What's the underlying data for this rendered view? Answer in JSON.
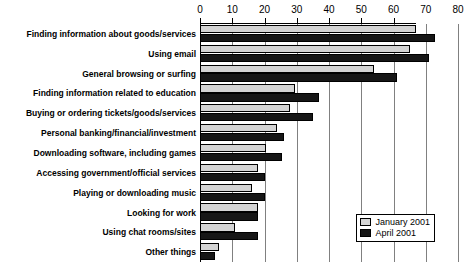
{
  "chart_data": {
    "type": "bar",
    "orientation": "horizontal",
    "title": "",
    "xlabel": "",
    "ylabel": "",
    "xlim": [
      0,
      80
    ],
    "xticks": [
      0,
      10,
      20,
      30,
      40,
      50,
      60,
      70,
      80
    ],
    "grid": true,
    "legend_position": "bottom-right",
    "categories": [
      "Finding information about goods/services",
      "Using email",
      "General browsing or surfing",
      "Finding information related to education",
      "Buying or ordering tickets/goods/services",
      "Personal banking/financial/investment",
      "Downloading software, including games",
      "Accessing government/official services",
      "Playing or downloading music",
      "Looking for work",
      "Using chat rooms/sites",
      "Other things"
    ],
    "series": [
      {
        "name": "January 2001",
        "color": "#d4d4d4",
        "values": [
          67,
          65,
          54,
          29.5,
          28,
          24,
          20.5,
          18,
          16,
          18,
          11,
          6
        ]
      },
      {
        "name": "April 2001",
        "color": "#161616",
        "values": [
          73,
          71,
          61,
          37,
          35,
          26,
          25.5,
          20,
          20,
          18,
          18,
          4.5
        ]
      }
    ]
  },
  "legend": {
    "entries": [
      {
        "label": "January 2001"
      },
      {
        "label": "April 2001"
      }
    ]
  }
}
